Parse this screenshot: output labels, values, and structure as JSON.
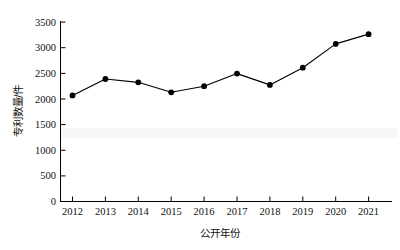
{
  "chart_data": {
    "type": "line",
    "title": "",
    "xlabel": "公开年份",
    "ylabel": "专利数量/件",
    "categories": [
      "2012",
      "2013",
      "2014",
      "2015",
      "2016",
      "2017",
      "2018",
      "2019",
      "2020",
      "2021"
    ],
    "values": [
      2070,
      2390,
      2325,
      2130,
      2250,
      2495,
      2275,
      2610,
      3075,
      3265
    ],
    "series": [
      {
        "name": "专利数量",
        "values": [
          2070,
          2390,
          2325,
          2130,
          2250,
          2495,
          2275,
          2610,
          3075,
          3265
        ]
      }
    ],
    "ylim": [
      0,
      3500
    ],
    "yticks": [
      0,
      500,
      1000,
      1500,
      2000,
      2500,
      3000,
      3500
    ],
    "ytick_labels": [
      "0",
      "500",
      "1000",
      "1500",
      "2000",
      "2500",
      "3000",
      "3500"
    ],
    "xlim": [
      "2012",
      "2021"
    ],
    "grid": false,
    "legend": "none",
    "marker": "filled-circle",
    "line_color": "#000000",
    "marker_color": "#000000",
    "background_color": "#ffffff"
  },
  "axes": {
    "y_axis_name": "y-axis",
    "x_axis_name": "x-axis"
  }
}
